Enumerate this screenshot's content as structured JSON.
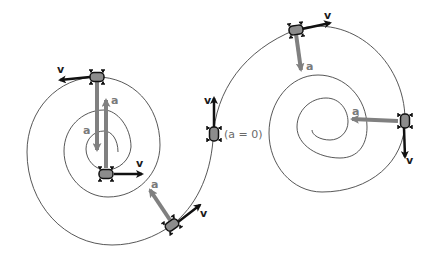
{
  "diagram": {
    "type": "motion-along-double-spiral-path",
    "colors": {
      "path": "#444444",
      "velocity_arrow": "#111111",
      "acceleration_arrow": "#808080",
      "car_body": "#8c8c8c",
      "car_outline": "#111111"
    },
    "labels": {
      "velocity": "v",
      "acceleration": "a",
      "zero_acceleration": "(a = 0)"
    },
    "cars": [
      {
        "id": "left-top",
        "velocity": "v",
        "acceleration": "a",
        "v_dir": "left",
        "a_dir": "down"
      },
      {
        "id": "left-center",
        "velocity": "v",
        "acceleration": "a",
        "v_dir": "right",
        "a_dir": "up"
      },
      {
        "id": "left-bottom-right",
        "velocity": "v",
        "acceleration": "a",
        "v_dir": "up-right",
        "a_dir": "up-left"
      },
      {
        "id": "inflection",
        "velocity": "v",
        "acceleration": "(a = 0)",
        "v_dir": "up",
        "a_dir": "none"
      },
      {
        "id": "right-top",
        "velocity": "v",
        "acceleration": "a",
        "v_dir": "right",
        "a_dir": "down"
      },
      {
        "id": "right-side",
        "velocity": "v",
        "acceleration": "a",
        "v_dir": "down",
        "a_dir": "left"
      }
    ]
  }
}
